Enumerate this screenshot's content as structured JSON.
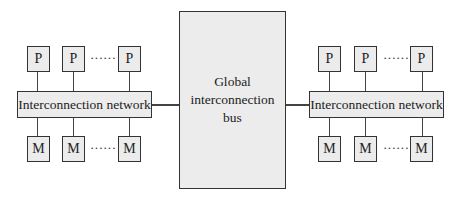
{
  "diagram": {
    "left_cluster": {
      "processors": [
        "P",
        "P",
        "P"
      ],
      "memories": [
        "M",
        "M",
        "M"
      ],
      "network_label": "Interconnection network",
      "ellipsis": "······"
    },
    "center": {
      "line1": "Global",
      "line2": "interconnection",
      "line3": "bus"
    },
    "right_cluster": {
      "processors": [
        "P",
        "P",
        "P"
      ],
      "memories": [
        "M",
        "M",
        "M"
      ],
      "network_label": "Interconnection network",
      "ellipsis": "······"
    }
  }
}
